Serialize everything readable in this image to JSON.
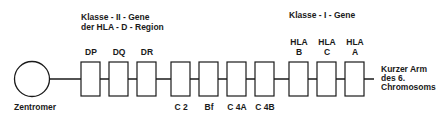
{
  "class2_title": {
    "line1": "Klasse - II - Gene",
    "line2": "der  HLA - D - Region"
  },
  "class1_title": "Klasse - I - Gene",
  "centromere_label": "Zentromer",
  "arm_label": {
    "line1": "Kurzer  Arm",
    "line2": "des  6.",
    "line3": "Chromosoms"
  },
  "genes": [
    {
      "label_top": "DP",
      "label_bottom": ""
    },
    {
      "label_top": "DQ",
      "label_bottom": ""
    },
    {
      "label_top": "DR",
      "label_bottom": ""
    },
    {
      "label_top": "",
      "label_bottom": "C 2"
    },
    {
      "label_top": "",
      "label_bottom": "Bf"
    },
    {
      "label_top": "",
      "label_bottom": "C 4A"
    },
    {
      "label_top": "",
      "label_bottom": "C 4B"
    },
    {
      "label_top": "HLA",
      "label_top2": "B",
      "label_bottom": ""
    },
    {
      "label_top": "HLA",
      "label_top2": "C",
      "label_bottom": ""
    },
    {
      "label_top": "HLA",
      "label_top2": "A",
      "label_bottom": ""
    }
  ]
}
